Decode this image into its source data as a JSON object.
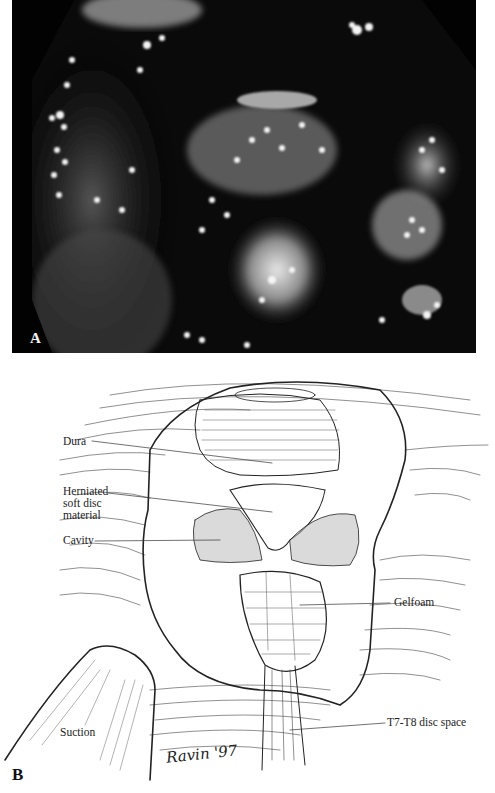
{
  "figure": {
    "panel_a": {
      "label": "A",
      "description": "Endoscopic (thoracoscopic) photograph, grayscale, octagonal clipped-corner view"
    },
    "panel_b": {
      "label": "B",
      "description": "Line illustration of thoracoscopic disc excision field",
      "callouts": [
        {
          "id": "dura",
          "text": "Dura"
        },
        {
          "id": "herniated",
          "lines": [
            "Herniated",
            "soft disc",
            "material"
          ]
        },
        {
          "id": "cavity",
          "text": "Cavity"
        },
        {
          "id": "gelfoam",
          "text": "Gelfoam"
        },
        {
          "id": "suction",
          "text": "Suction"
        },
        {
          "id": "disc-space",
          "text": "T7-T8 disc space"
        }
      ],
      "signature": "Ravin '97"
    }
  },
  "colors": {
    "photo_background": "#020202",
    "ink": "#111111",
    "paper": "#ffffff"
  }
}
